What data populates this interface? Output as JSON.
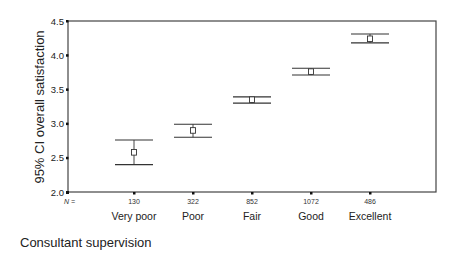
{
  "chart_data": {
    "type": "errorbar",
    "title": "",
    "xlabel": "Consultant supervision",
    "ylabel": "95% CI overall satisfaction",
    "ylim": [
      2.0,
      4.5
    ],
    "yticks": [
      "2.0",
      "2.5",
      "3.0",
      "3.5",
      "4.0",
      "4.5"
    ],
    "n_label": "N =",
    "categories": [
      "Very poor",
      "Poor",
      "Fair",
      "Good",
      "Excellent"
    ],
    "n": [
      "130",
      "322",
      "852",
      "1072",
      "486"
    ],
    "mean": [
      2.58,
      2.9,
      3.35,
      3.76,
      4.24
    ],
    "ci_lower": [
      2.4,
      2.8,
      3.3,
      3.71,
      4.18
    ],
    "ci_upper": [
      2.76,
      2.99,
      3.39,
      3.81,
      4.31
    ],
    "grid": false,
    "legend": "none"
  },
  "colors": {
    "line": "#333333",
    "frame": "#444444",
    "background": "#ffffff"
  }
}
